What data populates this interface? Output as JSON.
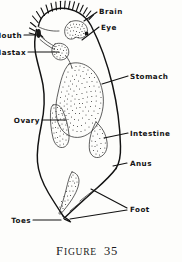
{
  "figure": {
    "caption_prefix": "F",
    "caption_word": "IGURE",
    "caption_number": "35",
    "caption_full": "FIGURE 35",
    "style": "line-drawing-stippled",
    "ink_color": "#121212",
    "paper_color": "#fdfdfb"
  },
  "labels": {
    "brain": "Brain",
    "eye": "Eye",
    "mouth": "Mouth",
    "mastax": "Mastax",
    "stomach": "Stomach",
    "ovary": "Ovary",
    "intestine": "Intestine",
    "anus": "Anus",
    "foot": "Foot",
    "toes": "Toes"
  },
  "parts": [
    {
      "name": "brain",
      "label": "Brain",
      "side": "right"
    },
    {
      "name": "eye",
      "label": "Eye",
      "side": "right"
    },
    {
      "name": "mouth",
      "label": "Mouth",
      "side": "left"
    },
    {
      "name": "mastax",
      "label": "Mastax",
      "side": "left"
    },
    {
      "name": "stomach",
      "label": "Stomach",
      "side": "right"
    },
    {
      "name": "ovary",
      "label": "Ovary",
      "side": "left"
    },
    {
      "name": "intestine",
      "label": "Intestine",
      "side": "right"
    },
    {
      "name": "anus",
      "label": "Anus",
      "side": "right"
    },
    {
      "name": "foot",
      "label": "Foot",
      "side": "right"
    },
    {
      "name": "toes",
      "label": "Toes",
      "side": "left"
    }
  ]
}
